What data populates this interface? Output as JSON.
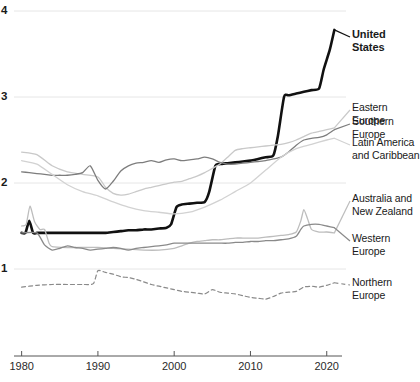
{
  "chart_data": {
    "type": "line",
    "title": "",
    "subtitle": "",
    "xlabel": "",
    "ylabel": "",
    "xlim": [
      1979,
      2022
    ],
    "ylim": [
      0.35,
      4.05
    ],
    "grid": true,
    "gridlines_y": [
      1,
      2,
      3,
      4
    ],
    "legend_position": "right-inline",
    "y_ticks": [
      "1",
      "2",
      "3",
      "4"
    ],
    "x_ticks": [
      "1980",
      "1990",
      "2000",
      "2010",
      "2020"
    ],
    "x_tick_values": [
      1980,
      1990,
      2000,
      2010,
      2020
    ],
    "series": [
      {
        "name": "United States",
        "label": "United\nStates",
        "color": "#111111",
        "width": 2.6,
        "dash": "none",
        "label_y": 28,
        "bold": true,
        "x": [
          1980,
          1980.5,
          1981,
          1981.5,
          1982,
          1983,
          1984,
          1985,
          1986,
          1987,
          1988,
          1989,
          1990,
          1991,
          1992,
          1993,
          1994,
          1995,
          1996,
          1997,
          1998,
          1999,
          1999.6,
          2000.3,
          2001,
          2002,
          2003,
          2004,
          2004.6,
          2005.4,
          2006,
          2007,
          2008,
          2009,
          2010,
          2011,
          2012,
          2013,
          2013.6,
          2014.4,
          2015,
          2016,
          2017,
          2018,
          2019,
          2019.6,
          2020.4,
          2021
        ],
        "y": [
          1.42,
          1.42,
          1.56,
          1.42,
          1.42,
          1.42,
          1.42,
          1.42,
          1.42,
          1.42,
          1.42,
          1.42,
          1.42,
          1.42,
          1.43,
          1.44,
          1.45,
          1.45,
          1.46,
          1.46,
          1.47,
          1.48,
          1.52,
          1.72,
          1.75,
          1.76,
          1.77,
          1.78,
          1.9,
          2.2,
          2.22,
          2.23,
          2.24,
          2.25,
          2.26,
          2.28,
          2.3,
          2.32,
          2.55,
          3.0,
          3.02,
          3.04,
          3.06,
          3.08,
          3.1,
          3.32,
          3.55,
          3.78
        ]
      },
      {
        "name": "Eastern Europe",
        "label": "Eastern Europe",
        "color": "#c9c9c9",
        "width": 1.3,
        "dash": "none",
        "label_y": 101,
        "bold": false,
        "x": [
          1980,
          1982,
          1984,
          1986,
          1988,
          1990,
          1991,
          1992,
          1993,
          1994,
          1995,
          1996,
          1997,
          1998,
          1999,
          2000,
          2001,
          2002,
          2003,
          2004,
          2005,
          2006,
          2007,
          2008,
          2009,
          2010,
          2011,
          2012,
          2013,
          2014,
          2015,
          2016,
          2017,
          2018,
          2019,
          2020,
          2021
        ],
        "y": [
          2.36,
          2.33,
          2.2,
          2.13,
          2.1,
          2.07,
          1.95,
          1.88,
          1.86,
          1.87,
          1.9,
          1.93,
          1.95,
          1.97,
          1.99,
          2.01,
          2.02,
          2.05,
          2.08,
          2.12,
          2.17,
          2.22,
          2.3,
          2.38,
          2.4,
          2.41,
          2.42,
          2.43,
          2.44,
          2.45,
          2.47,
          2.5,
          2.54,
          2.58,
          2.6,
          2.62,
          2.64
        ]
      },
      {
        "name": "Southern Europe",
        "label": "Southern Europe",
        "color": "#7d7d7d",
        "width": 1.3,
        "dash": "none",
        "label_y": 115,
        "bold": false,
        "x": [
          1980,
          1981,
          1982,
          1983,
          1984,
          1985,
          1986,
          1987,
          1988,
          1989,
          1990,
          1991,
          1992,
          1993,
          1994,
          1995,
          1996,
          1997,
          1998,
          1999,
          2000,
          2001,
          2002,
          2003,
          2004,
          2005,
          2006,
          2007,
          2008,
          2009,
          2010,
          2011,
          2012,
          2013,
          2014,
          2015,
          2016,
          2017,
          2018,
          2019,
          2020,
          2021
        ],
        "y": [
          2.13,
          2.12,
          2.11,
          2.1,
          2.09,
          2.09,
          2.09,
          2.1,
          2.12,
          2.2,
          2.03,
          1.93,
          2.02,
          2.14,
          2.2,
          2.23,
          2.24,
          2.26,
          2.24,
          2.27,
          2.28,
          2.26,
          2.27,
          2.28,
          2.3,
          2.28,
          2.24,
          2.22,
          2.22,
          2.23,
          2.24,
          2.25,
          2.26,
          2.28,
          2.3,
          2.36,
          2.44,
          2.5,
          2.52,
          2.53,
          2.56,
          2.62
        ]
      },
      {
        "name": "Latin America and Caribbean",
        "label": "Latin America\nand Caribbean",
        "color": "#d2d2d2",
        "width": 1.3,
        "dash": "none",
        "label_y": 136,
        "bold": false,
        "x": [
          1980,
          1982,
          1984,
          1986,
          1988,
          1990,
          1992,
          1994,
          1996,
          1998,
          2000,
          2002,
          2004,
          2006,
          2008,
          2010,
          2012,
          2014,
          2016,
          2018,
          2020,
          2021
        ],
        "y": [
          2.26,
          2.22,
          2.1,
          1.98,
          1.9,
          1.85,
          1.78,
          1.72,
          1.68,
          1.66,
          1.64,
          1.66,
          1.72,
          1.8,
          1.9,
          2.0,
          2.15,
          2.3,
          2.4,
          2.45,
          2.5,
          2.52
        ]
      },
      {
        "name": "Australia and New Zealand",
        "label": "Australia and\nNew Zealand",
        "color": "#bdbdbd",
        "width": 1.3,
        "dash": "none",
        "label_y": 192,
        "bold": false,
        "x": [
          1980,
          1980.6,
          1981.1,
          1981.7,
          1982.4,
          1983,
          1983.6,
          1984,
          1986,
          1988,
          1990,
          1992,
          1994,
          1996,
          1998,
          2000,
          2001,
          2002,
          2003,
          2004,
          2005,
          2006,
          2007,
          2008,
          2009,
          2010,
          2011,
          2012,
          2013,
          2014,
          2015,
          2016,
          2016.6,
          2017,
          2017.5,
          2018,
          2019,
          2020,
          2021
        ],
        "y": [
          1.5,
          1.52,
          1.73,
          1.55,
          1.46,
          1.46,
          1.3,
          1.26,
          1.25,
          1.25,
          1.25,
          1.24,
          1.23,
          1.22,
          1.22,
          1.24,
          1.27,
          1.3,
          1.32,
          1.33,
          1.34,
          1.34,
          1.35,
          1.36,
          1.36,
          1.36,
          1.36,
          1.37,
          1.38,
          1.39,
          1.4,
          1.43,
          1.56,
          1.69,
          1.58,
          1.46,
          1.43,
          1.43,
          1.42
        ]
      },
      {
        "name": "Western Europe",
        "label": "Western Europe",
        "color": "#8a8a8a",
        "width": 1.3,
        "dash": "none",
        "label_y": 232,
        "bold": false,
        "x": [
          1980,
          1982,
          1983,
          1984,
          1985,
          1986,
          1987,
          1988,
          1989,
          1990,
          1991,
          1992,
          1993,
          1994,
          1995,
          1996,
          1997,
          1998,
          1999,
          2000,
          2001,
          2002,
          2003,
          2004,
          2005,
          2006,
          2007,
          2008,
          2009,
          2010,
          2011,
          2012,
          2013,
          2014,
          2015,
          2016,
          2016.6,
          2017,
          2018,
          2019,
          2020,
          2021
        ],
        "y": [
          1.42,
          1.42,
          1.28,
          1.22,
          1.24,
          1.27,
          1.25,
          1.24,
          1.22,
          1.23,
          1.24,
          1.25,
          1.24,
          1.22,
          1.24,
          1.25,
          1.26,
          1.27,
          1.28,
          1.3,
          1.3,
          1.3,
          1.3,
          1.3,
          1.3,
          1.3,
          1.3,
          1.31,
          1.31,
          1.32,
          1.32,
          1.33,
          1.33,
          1.34,
          1.35,
          1.38,
          1.46,
          1.5,
          1.52,
          1.52,
          1.5,
          1.48
        ]
      },
      {
        "name": "Northern Europe",
        "label": "Northern Europe",
        "color": "#8a8a8a",
        "width": 1.2,
        "dash": "4 3",
        "label_y": 276,
        "bold": false,
        "x": [
          1980,
          1982,
          1984,
          1986,
          1988,
          1989.4,
          1990,
          1991,
          1992,
          1993,
          1994,
          1995,
          1996,
          1997,
          1998,
          1999,
          2000,
          2001,
          2002,
          2003,
          2004,
          2005,
          2006,
          2007,
          2008,
          2009,
          2010,
          2011,
          2012,
          2013,
          2014,
          2015,
          2016,
          2017,
          2018,
          2019,
          2020,
          2021
        ],
        "y": [
          0.79,
          0.81,
          0.82,
          0.82,
          0.82,
          0.83,
          0.98,
          0.96,
          0.94,
          0.91,
          0.9,
          0.88,
          0.85,
          0.82,
          0.8,
          0.78,
          0.76,
          0.74,
          0.73,
          0.72,
          0.71,
          0.76,
          0.73,
          0.72,
          0.71,
          0.69,
          0.67,
          0.66,
          0.65,
          0.68,
          0.72,
          0.73,
          0.74,
          0.79,
          0.8,
          0.79,
          0.81,
          0.84
        ]
      }
    ]
  },
  "axis": {
    "y_tick_labels": [
      {
        "text": "4",
        "y": 4
      },
      {
        "text": "3",
        "y": 3
      },
      {
        "text": "2",
        "y": 2
      },
      {
        "text": "1",
        "y": 1
      }
    ],
    "x_tick_labels": [
      {
        "text": "1980",
        "x": 1980
      },
      {
        "text": "1990",
        "x": 1990
      },
      {
        "text": "2000",
        "x": 2000
      },
      {
        "text": "2010",
        "x": 2010
      },
      {
        "text": "2020",
        "x": 2020
      }
    ]
  },
  "style": {
    "grid_color": "#e6e6e6",
    "axis_color": "#555555",
    "background": "#ffffff"
  }
}
